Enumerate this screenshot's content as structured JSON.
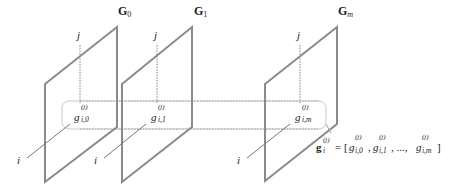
{
  "figure": {
    "panels": [
      {
        "id": "G0",
        "label_main": "G",
        "label_sub": "0",
        "entry_base": "g",
        "entry_sup": "(j)",
        "entry_sub": "i,0"
      },
      {
        "id": "G1",
        "label_main": "G",
        "label_sub": "1",
        "entry_base": "g",
        "entry_sup": "(j)",
        "entry_sub": "i,1"
      },
      {
        "id": "Gm",
        "label_main": "G",
        "label_sub": "m",
        "entry_base": "g",
        "entry_sup": "(j)",
        "entry_sub": "i,m"
      }
    ],
    "axis_labels": {
      "row": "i",
      "col": "j"
    },
    "formula": {
      "lhs_base": "g",
      "lhs_sub": "i",
      "lhs_sup": "(j)",
      "equals": "= [",
      "t0_base": "g",
      "t0_sup": "(j)",
      "t0_sub": "i,0",
      "sep1": ",",
      "t1_base": "g",
      "t1_sup": "(j)",
      "t1_sub": "i,1",
      "sep2": ", ...,",
      "tm_base": "g",
      "tm_sup": "(j)",
      "tm_sub": "i,m",
      "close": "]"
    },
    "colors": {
      "panel_stroke": "#8a8a8a",
      "guide_stroke": "#a0a0a0",
      "highlight_box": "#c8c8c8",
      "text": "#222222"
    }
  }
}
